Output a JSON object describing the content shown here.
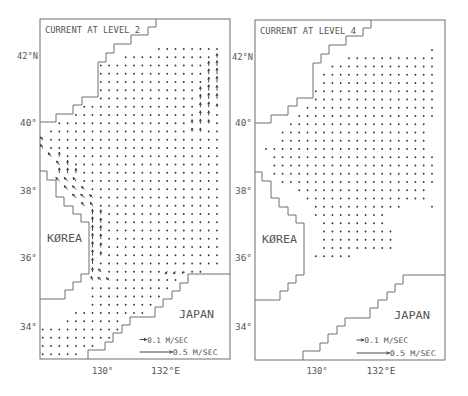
{
  "figure": {
    "scale_px_per_ms": 64,
    "map": {
      "frame": {
        "w": 190,
        "h": 340
      },
      "grid": {
        "x0": 2.7,
        "dx": 8.3,
        "y0": 30,
        "dy": 8.25
      },
      "coastlines": {
        "north": [
          [
            116,
            0
          ],
          [
            116,
            8
          ],
          [
            108,
            8
          ],
          [
            108,
            16
          ],
          [
            91,
            16
          ],
          [
            91,
            25
          ],
          [
            74,
            25
          ],
          [
            74,
            34
          ],
          [
            66,
            34
          ],
          [
            66,
            43
          ],
          [
            58,
            43
          ],
          [
            58,
            78
          ],
          [
            42,
            78
          ],
          [
            42,
            86
          ],
          [
            33,
            86
          ],
          [
            33,
            95
          ],
          [
            16,
            95
          ],
          [
            16,
            103
          ],
          [
            0,
            103
          ]
        ],
        "korea": [
          [
            0,
            152
          ],
          [
            7,
            152
          ],
          [
            7,
            161
          ],
          [
            16,
            161
          ],
          [
            16,
            178
          ],
          [
            24,
            178
          ],
          [
            24,
            187
          ],
          [
            33,
            187
          ],
          [
            33,
            195
          ],
          [
            41,
            195
          ],
          [
            41,
            203
          ],
          [
            49,
            203
          ],
          [
            49,
            255
          ],
          [
            41,
            255
          ],
          [
            41,
            263
          ],
          [
            33,
            263
          ],
          [
            33,
            271
          ],
          [
            25,
            271
          ],
          [
            25,
            280
          ],
          [
            0,
            280
          ]
        ],
        "japan": [
          [
            190,
            255
          ],
          [
            148,
            255
          ],
          [
            148,
            264
          ],
          [
            140,
            264
          ],
          [
            140,
            272
          ],
          [
            132,
            272
          ],
          [
            132,
            280
          ],
          [
            123,
            280
          ],
          [
            123,
            288
          ],
          [
            115,
            288
          ],
          [
            115,
            298
          ],
          [
            90,
            298
          ],
          [
            90,
            306
          ],
          [
            82,
            306
          ],
          [
            82,
            314
          ],
          [
            73,
            314
          ],
          [
            73,
            323
          ],
          [
            65,
            323
          ],
          [
            65,
            331
          ],
          [
            48,
            331
          ],
          [
            48,
            340
          ]
        ]
      },
      "lat_labels": [
        "42°N",
        "40°",
        "38°",
        "36°",
        "34°"
      ],
      "lon_labels": [
        "130°",
        "132°E"
      ],
      "land_labels": {
        "korea": "KØREA",
        "japan": "JAPAN"
      }
    },
    "legend": [
      {
        "label": "0.1 M/SEC",
        "speed_ms": 0.1
      },
      {
        "label": "0.5 M/SEC",
        "speed_ms": 0.5
      }
    ],
    "panels": [
      {
        "title": "CURRENT AT LEVEL 2",
        "level": 2,
        "rows": [
          [
            0,
            14,
            21
          ],
          [
            1,
            10,
            21
          ],
          [
            2,
            7,
            21
          ],
          [
            3,
            7,
            21
          ],
          [
            4,
            7,
            21
          ],
          [
            5,
            7,
            21
          ],
          [
            6,
            7,
            21
          ],
          [
            7,
            5,
            21
          ],
          [
            8,
            4,
            21
          ],
          [
            9,
            2,
            21
          ],
          [
            10,
            1,
            21
          ],
          [
            11,
            0,
            21
          ],
          [
            12,
            0,
            21
          ],
          [
            13,
            1,
            21
          ],
          [
            14,
            2,
            21
          ],
          [
            15,
            2,
            21
          ],
          [
            16,
            2,
            21
          ],
          [
            17,
            3,
            21
          ],
          [
            18,
            4,
            21
          ],
          [
            19,
            5,
            21
          ],
          [
            20,
            6,
            21
          ],
          [
            21,
            6,
            21
          ],
          [
            22,
            6,
            21
          ],
          [
            23,
            6,
            21
          ],
          [
            24,
            6,
            21
          ],
          [
            25,
            6,
            21
          ],
          [
            26,
            6,
            21
          ],
          [
            27,
            6,
            19
          ],
          [
            28,
            6,
            16
          ],
          [
            29,
            6,
            15
          ],
          [
            30,
            6,
            14
          ],
          [
            31,
            6,
            13
          ],
          [
            32,
            4,
            12
          ],
          [
            33,
            3,
            9
          ],
          [
            34,
            0,
            9
          ],
          [
            35,
            0,
            8
          ],
          [
            36,
            0,
            6
          ],
          [
            37,
            0,
            4
          ]
        ],
        "vectors": [
          [
            1,
            21,
            0,
            0.05
          ],
          [
            2,
            20,
            0,
            0.06
          ],
          [
            2,
            21,
            0,
            0.07
          ],
          [
            3,
            20,
            0,
            0.07
          ],
          [
            3,
            21,
            0,
            0.08
          ],
          [
            4,
            20,
            0,
            0.07
          ],
          [
            4,
            21,
            0,
            0.08
          ],
          [
            5,
            19,
            0,
            0.05
          ],
          [
            5,
            20,
            0,
            0.08
          ],
          [
            5,
            21,
            0,
            0.07
          ],
          [
            6,
            19,
            0,
            0.06
          ],
          [
            6,
            20,
            0,
            0.08
          ],
          [
            6,
            21,
            0,
            0.07
          ],
          [
            7,
            19,
            0,
            0.06
          ],
          [
            7,
            20,
            0,
            0.07
          ],
          [
            7,
            21,
            0,
            0.04
          ],
          [
            8,
            19,
            0,
            0.06
          ],
          [
            8,
            20,
            0,
            0.06
          ],
          [
            9,
            18,
            0,
            0.05
          ],
          [
            9,
            19,
            0,
            0.06
          ],
          [
            9,
            20,
            0,
            0.05
          ],
          [
            10,
            18,
            0,
            0.05
          ],
          [
            10,
            19,
            0,
            0.05
          ],
          [
            11,
            0,
            -0.03,
            0.04
          ],
          [
            12,
            0,
            -0.03,
            0.05
          ],
          [
            13,
            1,
            -0.04,
            0.05
          ],
          [
            13,
            2,
            0,
            0.06
          ],
          [
            14,
            2,
            -0.04,
            0.05
          ],
          [
            14,
            3,
            0,
            0.06
          ],
          [
            15,
            2,
            0,
            0.07
          ],
          [
            15,
            3,
            0,
            0.07
          ],
          [
            15,
            4,
            0,
            0.06
          ],
          [
            16,
            2,
            -0.05,
            0.05
          ],
          [
            16,
            3,
            -0.05,
            0.05
          ],
          [
            16,
            4,
            -0.04,
            0.05
          ],
          [
            17,
            3,
            -0.05,
            0.05
          ],
          [
            17,
            4,
            -0.05,
            0.05
          ],
          [
            17,
            5,
            -0.04,
            0.04
          ],
          [
            18,
            4,
            -0.05,
            0.05
          ],
          [
            18,
            5,
            -0.05,
            0.05
          ],
          [
            18,
            6,
            -0.04,
            0.04
          ],
          [
            19,
            5,
            -0.04,
            0.05
          ],
          [
            19,
            6,
            -0.03,
            0.05
          ],
          [
            20,
            6,
            0,
            0.07
          ],
          [
            20,
            7,
            0,
            0.06
          ],
          [
            21,
            6,
            0,
            0.08
          ],
          [
            21,
            7,
            0,
            0.06
          ],
          [
            22,
            6,
            0,
            0.08
          ],
          [
            22,
            7,
            0,
            0.07
          ],
          [
            23,
            6,
            0,
            0.08
          ],
          [
            23,
            7,
            0,
            0.07
          ],
          [
            24,
            6,
            0,
            0.08
          ],
          [
            24,
            7,
            0,
            0.06
          ],
          [
            25,
            6,
            0,
            0.08
          ],
          [
            25,
            7,
            0,
            0.05
          ],
          [
            26,
            6,
            0,
            0.08
          ],
          [
            27,
            6,
            0,
            0.06
          ],
          [
            27,
            7,
            -0.03,
            0.04
          ],
          [
            27,
            15,
            -0.03,
            -0.03
          ],
          [
            27,
            16,
            -0.03,
            -0.03
          ],
          [
            27,
            17,
            -0.02,
            -0.02
          ],
          [
            28,
            6,
            -0.02,
            0.05
          ],
          [
            28,
            7,
            -0.04,
            0.04
          ],
          [
            28,
            8,
            -0.04,
            0.03
          ]
        ]
      },
      {
        "title": "CURRENT AT LEVEL 4",
        "level": 4,
        "rows": [
          [
            0,
            21,
            21
          ],
          [
            1,
            11,
            21
          ],
          [
            2,
            9,
            21
          ],
          [
            3,
            8,
            21
          ],
          [
            4,
            8,
            21
          ],
          [
            5,
            7,
            21
          ],
          [
            6,
            7,
            21
          ],
          [
            7,
            6,
            21
          ],
          [
            8,
            5,
            21
          ],
          [
            9,
            4,
            20
          ],
          [
            10,
            3,
            20
          ],
          [
            11,
            3,
            20
          ],
          [
            12,
            1,
            20
          ],
          [
            13,
            2,
            21
          ],
          [
            14,
            2,
            21
          ],
          [
            15,
            2,
            21
          ],
          [
            16,
            3,
            21
          ],
          [
            17,
            5,
            20
          ],
          [
            18,
            6,
            20
          ],
          [
            19,
            7,
            17
          ],
          [
            19,
            21,
            21
          ],
          [
            20,
            7,
            15
          ],
          [
            21,
            8,
            15
          ],
          [
            22,
            8,
            16
          ],
          [
            23,
            8,
            16
          ],
          [
            24,
            8,
            16
          ],
          [
            25,
            7,
            11
          ]
        ],
        "vectors": []
      }
    ]
  },
  "colors": {
    "line": "#6e6e6e",
    "text": "#555555",
    "vector": "#333333",
    "background": "#ffffff"
  }
}
